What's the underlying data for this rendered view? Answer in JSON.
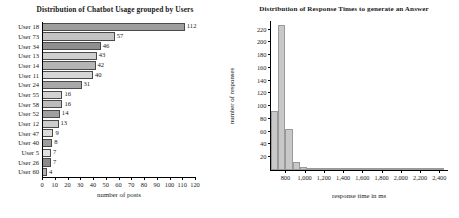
{
  "chart_data": [
    {
      "type": "bar",
      "orientation": "horizontal",
      "title": "Distribution of Chatbot Usage grouped by Users",
      "xlabel": "number of posts",
      "ylabel": "",
      "categories": [
        "User 18",
        "User 73",
        "User 34",
        "User 13",
        "User 14",
        "User 11",
        "User 24",
        "User 55",
        "User 58",
        "User 52",
        "User 12",
        "User 47",
        "User 40",
        "User 5",
        "User 26",
        "User 60"
      ],
      "values": [
        112,
        57,
        46,
        43,
        42,
        40,
        31,
        16,
        16,
        14,
        13,
        9,
        8,
        7,
        7,
        4
      ],
      "data_labels": [
        "112",
        "57",
        "46",
        "43",
        "42",
        "40",
        "31",
        "16",
        "16",
        "14",
        "13",
        "9",
        "8",
        "7",
        "7",
        "4"
      ],
      "xlim": [
        0,
        120
      ],
      "xticks": [
        0,
        10,
        20,
        30,
        40,
        50,
        60,
        70,
        80,
        90,
        100,
        110,
        120
      ],
      "xticklabels": [
        "0",
        "10",
        "20",
        "30",
        "40",
        "50",
        "60",
        "70",
        "80",
        "90",
        "100",
        "110",
        "120"
      ],
      "grid": false,
      "legend": "none",
      "bar_colors": [
        "#9e9e9e",
        "#c4c4c4",
        "#8f8f8f",
        "#cfcfcf",
        "#b5b5b5",
        "#d6d6d6",
        "#a8a8a8",
        "#d2d2d2",
        "#bcbcbc",
        "#a0a0a0",
        "#cdcdcd",
        "#dcdcdc",
        "#9c9c9c",
        "#e0e0e0",
        "#8a8a8a",
        "#b0b0b0"
      ]
    },
    {
      "type": "bar",
      "subtype": "histogram",
      "title": "Distribution of Response Times to generate an Answer",
      "xlabel": "response time in ms",
      "ylabel": "number of responses",
      "bin_edges": [
        650,
        725,
        800,
        875,
        950,
        1025,
        1100,
        1175,
        1250,
        1325,
        1400,
        1475,
        1550,
        1625,
        1700,
        1775,
        1850,
        1925,
        2000,
        2075,
        2150,
        2225,
        2300,
        2375,
        2450
      ],
      "values": [
        93,
        228,
        64,
        12,
        5,
        2,
        1,
        1,
        1,
        1,
        1,
        1,
        1,
        1,
        1,
        1,
        1,
        1,
        1,
        1,
        1,
        1,
        1,
        1
      ],
      "xlim": [
        650,
        2480
      ],
      "ylim": [
        0,
        232
      ],
      "yticks": [
        20,
        40,
        60,
        80,
        100,
        120,
        140,
        160,
        180,
        200,
        220
      ],
      "yticklabels": [
        "20",
        "40",
        "60",
        "80",
        "100",
        "120",
        "140",
        "160",
        "180",
        "200",
        "220"
      ],
      "xticks": [
        800,
        1000,
        1200,
        1400,
        1600,
        1800,
        2000,
        2200,
        2400
      ],
      "xticklabels": [
        "800",
        "1,000",
        "1,200",
        "1,400",
        "1,600",
        "1,800",
        "2,000",
        "2,200",
        "2,400"
      ],
      "grid": false,
      "legend": "none",
      "bar_color": "#c8c8c8"
    }
  ],
  "left": {
    "title": "Distribution of Chatbot Usage grouped by Users",
    "xlabel": "number of posts"
  },
  "right": {
    "title": "Distribution of Response Times to generate an Answer",
    "xlabel": "response time in ms",
    "ylabel": "number of responses"
  }
}
